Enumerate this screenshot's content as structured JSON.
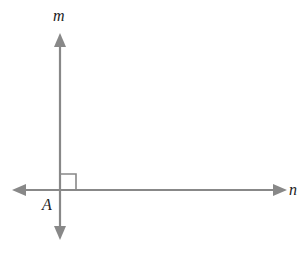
{
  "diagram": {
    "labels": {
      "line_vertical": "m",
      "line_horizontal": "n",
      "intersection_point": "A"
    },
    "line_color": "#888888",
    "label_color": "#222222",
    "right_angle_marker": true
  }
}
